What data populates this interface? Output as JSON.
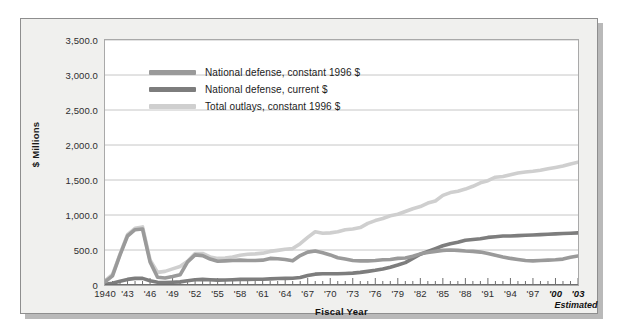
{
  "chart_data": {
    "type": "line",
    "title": "",
    "xlabel": "Fiscal Year",
    "ylabel": "$ Millions",
    "ylim": [
      0,
      3500
    ],
    "xlim": [
      1940,
      2003
    ],
    "grid": true,
    "legend_position": "top-left",
    "y_ticks": [
      "0",
      "500.0",
      "1,000.0",
      "1,500.0",
      "2,000.0",
      "2,500.0",
      "3,000.0",
      "3,500.0"
    ],
    "y_tick_values": [
      0,
      500,
      1000,
      1500,
      2000,
      2500,
      3000,
      3500
    ],
    "x_ticks": [
      "1940",
      "'43",
      "'46",
      "'49",
      "'52",
      "'55",
      "'58",
      "'61",
      "'64",
      "'67",
      "'70",
      "'73",
      "'76",
      "'79",
      "'82",
      "'85",
      "'88",
      "'91",
      "'94",
      "'97",
      "'00",
      "'03"
    ],
    "x_tick_values": [
      1940,
      1943,
      1946,
      1949,
      1952,
      1955,
      1958,
      1961,
      1964,
      1967,
      1970,
      1973,
      1976,
      1979,
      1982,
      1985,
      1988,
      1991,
      1994,
      1997,
      2000,
      2003
    ],
    "x_ticks_emphasized": [
      "'00",
      "'03"
    ],
    "annotations": [
      {
        "text": "Estimated",
        "near_tick": "'03"
      }
    ],
    "x": [
      1940,
      1941,
      1942,
      1943,
      1944,
      1945,
      1946,
      1947,
      1948,
      1949,
      1950,
      1951,
      1952,
      1953,
      1954,
      1955,
      1956,
      1957,
      1958,
      1959,
      1960,
      1961,
      1962,
      1963,
      1964,
      1965,
      1966,
      1967,
      1968,
      1969,
      1970,
      1971,
      1972,
      1973,
      1974,
      1975,
      1976,
      1977,
      1978,
      1979,
      1980,
      1981,
      1982,
      1983,
      1984,
      1985,
      1986,
      1987,
      1988,
      1989,
      1990,
      1991,
      1992,
      1993,
      1994,
      1995,
      1996,
      1997,
      1998,
      1999,
      2000,
      2001,
      2002,
      2003
    ],
    "series": [
      {
        "name": "National defense, constant 1996 $",
        "color": "#9a9a9a",
        "values": [
          45,
          130,
          430,
          700,
          790,
          800,
          330,
          110,
          100,
          120,
          145,
          330,
          430,
          420,
          370,
          340,
          345,
          350,
          355,
          350,
          350,
          355,
          380,
          375,
          365,
          345,
          420,
          470,
          485,
          460,
          430,
          390,
          370,
          350,
          345,
          345,
          350,
          360,
          365,
          380,
          385,
          410,
          445,
          465,
          480,
          495,
          500,
          495,
          485,
          480,
          470,
          450,
          425,
          400,
          380,
          365,
          350,
          345,
          350,
          355,
          360,
          370,
          395,
          415
        ]
      },
      {
        "name": "National defense, current $",
        "color": "#7d7d7d",
        "values": [
          10,
          25,
          55,
          80,
          95,
          95,
          60,
          40,
          35,
          40,
          45,
          60,
          75,
          80,
          75,
          70,
          72,
          76,
          80,
          81,
          82,
          83,
          88,
          92,
          95,
          96,
          107,
          135,
          155,
          160,
          160,
          160,
          165,
          170,
          180,
          195,
          210,
          230,
          255,
          285,
          320,
          380,
          440,
          480,
          520,
          560,
          590,
          610,
          640,
          650,
          660,
          680,
          690,
          700,
          700,
          705,
          710,
          715,
          720,
          725,
          730,
          735,
          740,
          745
        ]
      },
      {
        "name": "Total outlays, constant 1996 $",
        "color": "#cfcfcf",
        "values": [
          60,
          150,
          440,
          720,
          810,
          830,
          360,
          180,
          195,
          230,
          265,
          340,
          450,
          450,
          400,
          380,
          385,
          400,
          425,
          440,
          445,
          455,
          480,
          495,
          510,
          520,
          590,
          680,
          760,
          740,
          745,
          760,
          790,
          800,
          820,
          880,
          920,
          950,
          990,
          1010,
          1050,
          1090,
          1120,
          1170,
          1200,
          1280,
          1320,
          1340,
          1370,
          1410,
          1460,
          1490,
          1540,
          1550,
          1575,
          1600,
          1615,
          1625,
          1640,
          1660,
          1680,
          1700,
          1730,
          1755
        ]
      }
    ]
  },
  "chart": {
    "series_display": [
      {
        "label": "National defense, constant 1996 $",
        "color": "#9a9a9a"
      },
      {
        "label": "National defense, current $",
        "color": "#7d7d7d"
      },
      {
        "label": "Total outlays, constant 1996 $",
        "color": "#cfcfcf"
      }
    ],
    "estimated_label": "Estimated"
  }
}
